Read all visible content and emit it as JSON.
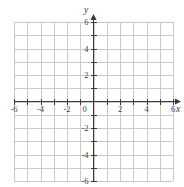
{
  "chart_data": {
    "type": "scatter",
    "title": "",
    "subtitle": "",
    "xlabel": "x",
    "ylabel": "y",
    "xlim": [
      -6,
      6
    ],
    "ylim": [
      -6,
      6
    ],
    "x_ticks": [
      -6,
      -4,
      -2,
      0,
      2,
      4,
      6
    ],
    "y_ticks": [
      6,
      4,
      2,
      -2,
      -4,
      -6
    ],
    "x_tick_labels": [
      "-6",
      "-4",
      "-2",
      "0",
      "2",
      "4",
      "6"
    ],
    "y_tick_labels": [
      "6",
      "4",
      "2",
      "-2",
      "-4",
      "-6"
    ],
    "minor_tick_step": 1,
    "grid": true,
    "grid_step": 1,
    "grid_columns": 12,
    "grid_rows": 12,
    "legend": null,
    "legend_position": "none",
    "series": [],
    "annotations": [],
    "axis_arrows": [
      "x-positive",
      "y-positive"
    ],
    "origin_label": "0",
    "colors": {
      "grid": "#c9c9c9",
      "axis": "#3a3a3a",
      "tick_label": "#444444",
      "background": "#ffffff"
    }
  },
  "figure": {
    "caption": "",
    "x_axis_name": "x",
    "y_axis_name": "y"
  }
}
